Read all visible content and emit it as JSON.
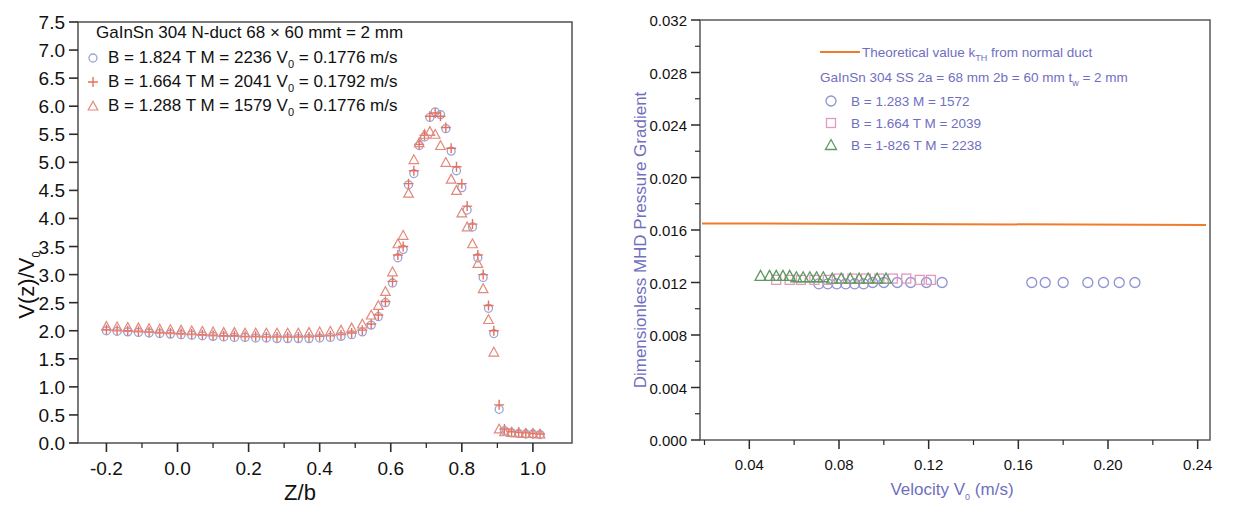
{
  "figure": {
    "background": "#ffffff",
    "panels": [
      "left-velocity-profile",
      "right-pressure-gradient"
    ]
  },
  "left": {
    "axes": {
      "xlabel": "Z/b",
      "ylabel_main": "V(z)/V",
      "ylabel_sub": "0",
      "xticks": [
        "-0.2",
        "0.0",
        "0.2",
        "0.4",
        "0.6",
        "0.8",
        "1.0"
      ],
      "xtickvals": [
        -0.2,
        0.0,
        0.2,
        0.4,
        0.6,
        0.8,
        1.0
      ],
      "yticks": [
        "0.0",
        "0.5",
        "1.0",
        "1.5",
        "2.0",
        "2.5",
        "3.0",
        "3.5",
        "4.0",
        "4.5",
        "5.0",
        "5.5",
        "6.0",
        "6.5",
        "7.0",
        "7.5"
      ],
      "ytickvals": [
        0.0,
        0.5,
        1.0,
        1.5,
        2.0,
        2.5,
        3.0,
        3.5,
        4.0,
        4.5,
        5.0,
        5.5,
        6.0,
        6.5,
        7.0,
        7.5
      ],
      "xlim": [
        -0.28,
        1.11
      ],
      "ylim": [
        0.0,
        7.5
      ]
    },
    "legend": {
      "title": "GaInSn   304 N-duct 68 × 60 mmt = 2 mm",
      "entries": [
        {
          "marker": "circle",
          "color": "#9aa3d8",
          "text_a": "B = 1.824 T  M = 2236  V",
          "sub": "0",
          "text_b": " = 0.1776 m/s"
        },
        {
          "marker": "plus",
          "color": "#e8705a",
          "text_a": "B = 1.664 T  M = 2041  V",
          "sub": "0",
          "text_b": " = 0.1792 m/s"
        },
        {
          "marker": "triangle",
          "color": "#e2887c",
          "text_a": "B = 1.288 T  M = 1579  V",
          "sub": "0",
          "text_b": " = 0.1776 m/s"
        }
      ]
    }
  },
  "right": {
    "axes": {
      "xlabel_a": "Velocity V",
      "xlabel_sub": "0",
      "xlabel_b": " (m/s)",
      "ylabel": "Dimensionless MHD Pressure Gradient",
      "xticks": [
        "0.04",
        "0.08",
        "0.12",
        "0.16",
        "0.20",
        "0.24"
      ],
      "xtickvals": [
        0.04,
        0.08,
        0.12,
        0.16,
        0.2,
        0.24
      ],
      "yticks": [
        "0.000",
        "0.004",
        "0.008",
        "0.012",
        "0.016",
        "0.020",
        "0.024",
        "0.028",
        "0.032"
      ],
      "ytickvals": [
        0.0,
        0.004,
        0.008,
        0.012,
        0.016,
        0.02,
        0.024,
        0.028,
        0.032
      ],
      "xlim": [
        0.018,
        0.2455
      ],
      "ylim": [
        0.0,
        0.032
      ]
    },
    "legend": {
      "theory_label": "Theoretical value k",
      "theory_sub": "TH",
      "theory_tail": " from normal duct",
      "title_line": "GaInSn  304 SS  2a = 68 mm  2b = 60 mm  t",
      "title_sub": "w",
      "title_tail": " = 2 mm",
      "entries": [
        {
          "marker": "circle",
          "color": "#8f93cf",
          "text": "B = 1.283      M = 1572"
        },
        {
          "marker": "square",
          "color": "#e09ac0",
          "text": "B = 1.664 T   M = 2039"
        },
        {
          "marker": "triangle",
          "color": "#5e9a5e",
          "text": "B = 1-826 T   M = 2238"
        }
      ]
    }
  },
  "chart_data": [
    {
      "type": "scatter",
      "id": "left-velocity-profile",
      "title": "GaInSn   304 N-duct 68 × 60 mmt = 2 mm",
      "xlabel": "Z/b",
      "ylabel": "V(z)/V0",
      "xlim": [
        -0.28,
        1.11
      ],
      "ylim": [
        0.0,
        7.5
      ],
      "grid": false,
      "legend_position": "upper-left",
      "series": [
        {
          "name": "B = 1.824 T  M = 2236  V0 = 0.1776 m/s",
          "marker": "circle",
          "color": "#9aa3d8",
          "x": [
            -0.2,
            -0.17,
            -0.14,
            -0.11,
            -0.08,
            -0.05,
            -0.02,
            0.01,
            0.04,
            0.07,
            0.1,
            0.13,
            0.16,
            0.19,
            0.22,
            0.25,
            0.28,
            0.31,
            0.34,
            0.37,
            0.4,
            0.43,
            0.46,
            0.49,
            0.52,
            0.545,
            0.565,
            0.585,
            0.605,
            0.62,
            0.635,
            0.65,
            0.665,
            0.68,
            0.695,
            0.71,
            0.725,
            0.74,
            0.755,
            0.77,
            0.785,
            0.8,
            0.815,
            0.83,
            0.845,
            0.86,
            0.875,
            0.89,
            0.905,
            0.92,
            0.94,
            0.96,
            0.98,
            1.0,
            1.02
          ],
          "y": [
            2.0,
            1.99,
            1.98,
            1.97,
            1.96,
            1.95,
            1.94,
            1.93,
            1.92,
            1.91,
            1.9,
            1.89,
            1.88,
            1.88,
            1.87,
            1.87,
            1.86,
            1.86,
            1.86,
            1.86,
            1.87,
            1.88,
            1.9,
            1.93,
            1.98,
            2.1,
            2.25,
            2.5,
            2.85,
            3.3,
            3.45,
            4.6,
            4.8,
            5.3,
            5.45,
            5.8,
            5.9,
            5.85,
            5.6,
            5.2,
            4.85,
            4.55,
            4.15,
            3.85,
            3.3,
            2.95,
            2.4,
            1.95,
            0.6,
            0.22,
            0.18,
            0.17,
            0.16,
            0.16,
            0.15
          ]
        },
        {
          "name": "B = 1.664 T  M = 2041  V0 = 0.1792 m/s",
          "marker": "plus",
          "color": "#e8705a",
          "x": [
            -0.2,
            -0.17,
            -0.14,
            -0.11,
            -0.08,
            -0.05,
            -0.02,
            0.01,
            0.04,
            0.07,
            0.1,
            0.13,
            0.16,
            0.19,
            0.22,
            0.25,
            0.28,
            0.31,
            0.34,
            0.37,
            0.4,
            0.43,
            0.46,
            0.49,
            0.52,
            0.545,
            0.565,
            0.585,
            0.605,
            0.62,
            0.635,
            0.65,
            0.665,
            0.68,
            0.695,
            0.71,
            0.725,
            0.74,
            0.755,
            0.77,
            0.785,
            0.8,
            0.815,
            0.83,
            0.845,
            0.86,
            0.875,
            0.89,
            0.905,
            0.92,
            0.94,
            0.96,
            0.98,
            1.0,
            1.02
          ],
          "y": [
            2.02,
            2.01,
            2.0,
            1.99,
            1.98,
            1.97,
            1.96,
            1.95,
            1.94,
            1.93,
            1.92,
            1.91,
            1.91,
            1.9,
            1.9,
            1.89,
            1.89,
            1.89,
            1.89,
            1.89,
            1.9,
            1.91,
            1.93,
            1.96,
            2.01,
            2.12,
            2.28,
            2.52,
            2.88,
            3.35,
            3.5,
            4.62,
            4.85,
            5.32,
            5.48,
            5.82,
            5.88,
            5.82,
            5.62,
            5.25,
            4.92,
            4.62,
            4.22,
            3.9,
            3.35,
            3.0,
            2.45,
            2.0,
            0.68,
            0.25,
            0.2,
            0.19,
            0.18,
            0.17,
            0.16
          ]
        },
        {
          "name": "B = 1.288 T  M = 1579  V0 = 0.1776 m/s",
          "marker": "triangle",
          "color": "#e2887c",
          "x": [
            -0.2,
            -0.17,
            -0.14,
            -0.11,
            -0.08,
            -0.05,
            -0.02,
            0.01,
            0.04,
            0.07,
            0.1,
            0.13,
            0.16,
            0.19,
            0.22,
            0.25,
            0.28,
            0.31,
            0.34,
            0.37,
            0.4,
            0.43,
            0.46,
            0.49,
            0.52,
            0.545,
            0.565,
            0.585,
            0.605,
            0.62,
            0.635,
            0.65,
            0.665,
            0.68,
            0.695,
            0.71,
            0.725,
            0.74,
            0.755,
            0.77,
            0.785,
            0.8,
            0.815,
            0.83,
            0.845,
            0.86,
            0.875,
            0.89,
            0.905,
            0.92,
            0.94,
            0.96,
            0.98,
            1.0,
            1.02
          ],
          "y": [
            2.08,
            2.07,
            2.06,
            2.05,
            2.04,
            2.03,
            2.02,
            2.01,
            2.0,
            1.99,
            1.98,
            1.97,
            1.97,
            1.96,
            1.96,
            1.96,
            1.96,
            1.96,
            1.96,
            1.97,
            1.98,
            1.99,
            2.01,
            2.05,
            2.12,
            2.28,
            2.45,
            2.7,
            3.05,
            3.55,
            3.7,
            4.45,
            5.05,
            5.35,
            5.5,
            5.55,
            5.5,
            5.3,
            5.0,
            4.7,
            4.5,
            4.1,
            3.85,
            3.55,
            3.2,
            2.75,
            2.2,
            1.62,
            0.25,
            0.2,
            0.19,
            0.18,
            0.17,
            0.17,
            0.16
          ]
        }
      ]
    },
    {
      "type": "scatter",
      "id": "right-pressure-gradient",
      "title": "GaInSn  304 SS  2a = 68 mm  2b = 60 mm  tw = 2 mm",
      "xlabel": "Velocity V0 (m/s)",
      "ylabel": "Dimensionless MHD Pressure Gradient",
      "xlim": [
        0.018,
        0.2455
      ],
      "ylim": [
        0.0,
        0.032
      ],
      "grid": false,
      "legend_position": "upper-right",
      "reference_line": {
        "label": "Theoretical value kTH from normal duct",
        "color": "#f07c2b",
        "value": 0.0165
      },
      "series": [
        {
          "name": "B = 1.283  M = 1572",
          "marker": "circle",
          "color": "#8f93cf",
          "x": [
            0.071,
            0.075,
            0.079,
            0.083,
            0.087,
            0.091,
            0.095,
            0.1,
            0.106,
            0.112,
            0.119,
            0.126,
            0.166,
            0.172,
            0.18,
            0.191,
            0.198,
            0.205,
            0.212
          ],
          "y": [
            0.0119,
            0.0119,
            0.0119,
            0.0119,
            0.0119,
            0.0119,
            0.012,
            0.012,
            0.012,
            0.012,
            0.012,
            0.012,
            0.012,
            0.012,
            0.012,
            0.012,
            0.012,
            0.012,
            0.012
          ]
        },
        {
          "name": "B = 1.664 T  M = 2039",
          "marker": "square",
          "color": "#e09ac0",
          "x": [
            0.052,
            0.058,
            0.063,
            0.069,
            0.075,
            0.08,
            0.086,
            0.092,
            0.098,
            0.104,
            0.11,
            0.116,
            0.121
          ],
          "y": [
            0.0122,
            0.0122,
            0.0122,
            0.0122,
            0.0122,
            0.0123,
            0.0123,
            0.0123,
            0.0123,
            0.0123,
            0.0123,
            0.0122,
            0.0122
          ]
        },
        {
          "name": "B = 1-826 T  M = 2238",
          "marker": "triangle",
          "color": "#5e9a5e",
          "x": [
            0.045,
            0.049,
            0.052,
            0.055,
            0.058,
            0.061,
            0.064,
            0.067,
            0.07,
            0.073,
            0.077,
            0.081,
            0.085,
            0.089,
            0.093,
            0.097,
            0.101
          ],
          "y": [
            0.0125,
            0.0125,
            0.0125,
            0.0125,
            0.0125,
            0.0124,
            0.0124,
            0.0124,
            0.0124,
            0.0124,
            0.0123,
            0.0123,
            0.0123,
            0.0123,
            0.0123,
            0.0123,
            0.0123
          ]
        }
      ]
    }
  ]
}
